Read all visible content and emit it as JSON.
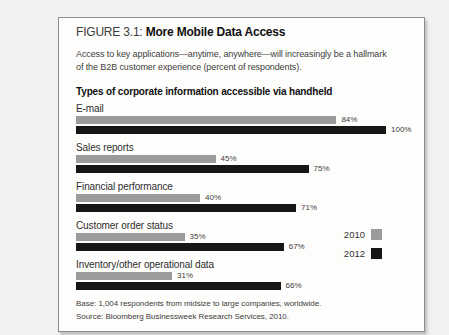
{
  "colors": {
    "bar_2010": "#9b9b9b",
    "bar_2012": "#161616",
    "page_bg": "#f2f1ef",
    "box_bg": "#fdfdfc",
    "box_border": "#8d8d8d"
  },
  "header": {
    "figure_label": "FIGURE 3.1:",
    "title": "More Mobile Data Access",
    "subtitle_lines": [
      "Access to key applications—anytime, anywhere—will increasingly be a hallmark",
      "of the B2B customer experience (percent of respondents)."
    ],
    "chart_heading": "Types of corporate information accessible via handheld"
  },
  "chart_data": {
    "type": "bar",
    "orientation": "horizontal",
    "title": "Types of corporate information accessible via handheld",
    "categories": [
      "E-mail",
      "Sales reports",
      "Financial performance",
      "Customer order status",
      "Inventory/other operational data"
    ],
    "series": [
      {
        "name": "2010",
        "color_key": "bar_2010",
        "values": [
          84,
          45,
          40,
          35,
          31
        ]
      },
      {
        "name": "2012",
        "color_key": "bar_2012",
        "values": [
          100,
          75,
          71,
          67,
          66
        ]
      }
    ],
    "value_suffix": "%",
    "xlim": [
      0,
      100
    ],
    "grid": false,
    "legend_position": "right",
    "value_labels": "outside-end"
  },
  "legend": {
    "entries": [
      {
        "label": "2010",
        "color_key": "bar_2010"
      },
      {
        "label": "2012",
        "color_key": "bar_2012"
      }
    ]
  },
  "footer": {
    "base_note": "Base: 1,004 respondents from midsize to large companies, worldwide.",
    "source_note": "Source: Bloomberg Businessweek Research Services, 2010."
  }
}
